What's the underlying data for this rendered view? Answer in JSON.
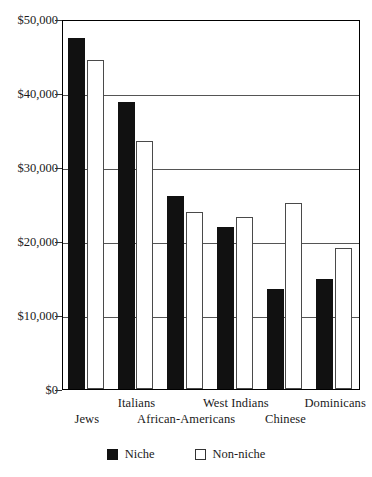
{
  "chart_data": {
    "type": "bar",
    "title": "",
    "subtitle": "",
    "xlabel": "",
    "ylabel": "",
    "categories": [
      "Jews",
      "Italians",
      "African-Americans",
      "West Indians",
      "Chinese",
      "Dominicans"
    ],
    "series": [
      {
        "name": "Niche",
        "values": [
          47500,
          38800,
          26100,
          21900,
          13500,
          14800
        ]
      },
      {
        "name": "Non-niche",
        "values": [
          44400,
          33500,
          23900,
          23200,
          25200,
          19100
        ]
      }
    ],
    "ylim": [
      0,
      50000
    ],
    "ytick_values": [
      0,
      10000,
      20000,
      30000,
      40000,
      50000
    ],
    "ytick_labels": [
      "$0",
      "$10,000",
      "$20,000",
      "$30,000",
      "$40,000",
      "$50,000"
    ],
    "grid": "horizontal",
    "legend_position": "bottom",
    "colors": {
      "niche": "#111111",
      "non_niche": "#ffffff",
      "outline": "#4a4a4a",
      "grid": "#555555"
    }
  },
  "axis": {
    "yticks": [
      {
        "label": "$50,000",
        "value": 50000
      },
      {
        "label": "$40,000",
        "value": 40000
      },
      {
        "label": "$30,000",
        "value": 30000
      },
      {
        "label": "$20,000",
        "value": 20000
      },
      {
        "label": "$10,000",
        "value": 10000
      },
      {
        "label": "$0",
        "value": 0
      }
    ],
    "xlabels": [
      {
        "label": "Jews",
        "row": "bottom"
      },
      {
        "label": "Italians",
        "row": "top"
      },
      {
        "label": "African-Americans",
        "row": "bottom"
      },
      {
        "label": "West Indians",
        "row": "top"
      },
      {
        "label": "Chinese",
        "row": "bottom"
      },
      {
        "label": "Dominicans",
        "row": "top"
      }
    ]
  },
  "legend": {
    "items": [
      {
        "label": "Niche",
        "style": "filled"
      },
      {
        "label": "Non-niche",
        "style": "hollow"
      }
    ]
  }
}
